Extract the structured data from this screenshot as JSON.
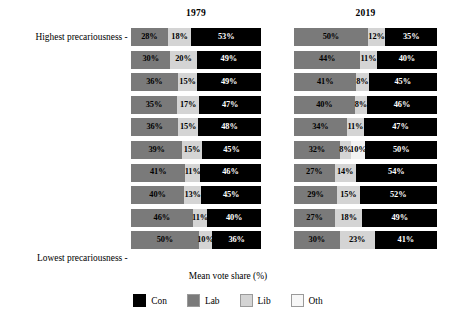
{
  "chart_data": {
    "type": "bar",
    "subtype": "stacked-horizontal-100-percent",
    "title": "",
    "xlabel": "Mean vote share (%)",
    "ylabel": "",
    "xlim": [
      0,
      100
    ],
    "grid": false,
    "legend_position": "bottom-center",
    "panels": [
      {
        "key": "p1979",
        "label": "1979"
      },
      {
        "key": "p2019",
        "label": "2019"
      }
    ],
    "categories": [
      "Highest precariousness",
      "",
      "",
      "",
      "",
      "",
      "",
      "",
      "",
      "Lowest precariousness"
    ],
    "axis_tick_labels": {
      "top": "Highest precariousness",
      "bottom": "Lowest precariousness"
    },
    "legend": [
      {
        "name": "Con",
        "color": "#000000"
      },
      {
        "name": "Lab",
        "color": "#7a7a7a"
      },
      {
        "name": "Lib",
        "color": "#d4d4d4"
      },
      {
        "name": "Oth",
        "color": "#f7f7f7"
      }
    ],
    "series_order": [
      "Lab",
      "Lib",
      "Oth",
      "Con"
    ],
    "p1979": [
      {
        "row": 1,
        "Lab": 28,
        "Lib": 18,
        "Oth": 0,
        "Con": 53
      },
      {
        "row": 2,
        "Lab": 30,
        "Lib": 20,
        "Oth": 0,
        "Con": 49
      },
      {
        "row": 3,
        "Lab": 36,
        "Lib": 15,
        "Oth": 0,
        "Con": 49
      },
      {
        "row": 4,
        "Lab": 35,
        "Lib": 17,
        "Oth": 0,
        "Con": 47
      },
      {
        "row": 5,
        "Lab": 36,
        "Lib": 15,
        "Oth": 0,
        "Con": 48
      },
      {
        "row": 6,
        "Lab": 39,
        "Lib": 15,
        "Oth": 0,
        "Con": 45
      },
      {
        "row": 7,
        "Lab": 41,
        "Lib": 11,
        "Oth": 0,
        "Con": 46
      },
      {
        "row": 8,
        "Lab": 40,
        "Lib": 13,
        "Oth": 0,
        "Con": 45
      },
      {
        "row": 9,
        "Lab": 46,
        "Lib": 11,
        "Oth": 0,
        "Con": 40
      },
      {
        "row": 10,
        "Lab": 50,
        "Lib": 10,
        "Oth": 0,
        "Con": 36
      }
    ],
    "p2019": [
      {
        "row": 1,
        "Lab": 50,
        "Lib": 12,
        "Oth": 0,
        "Con": 35
      },
      {
        "row": 2,
        "Lab": 44,
        "Lib": 11,
        "Oth": 0,
        "Con": 40
      },
      {
        "row": 3,
        "Lab": 41,
        "Lib": 8,
        "Oth": 0,
        "Con": 45
      },
      {
        "row": 4,
        "Lab": 40,
        "Lib": 8,
        "Oth": 0,
        "Con": 46
      },
      {
        "row": 5,
        "Lab": 34,
        "Lib": 11,
        "Oth": 0,
        "Con": 47
      },
      {
        "row": 6,
        "Lab": 32,
        "Lib": 8,
        "Oth": 10,
        "Con": 50
      },
      {
        "row": 7,
        "Lab": 27,
        "Lib": 14,
        "Oth": 0,
        "Con": 54
      },
      {
        "row": 8,
        "Lab": 29,
        "Lib": 15,
        "Oth": 0,
        "Con": 52
      },
      {
        "row": 9,
        "Lab": 27,
        "Lib": 18,
        "Oth": 0,
        "Con": 49
      },
      {
        "row": 10,
        "Lab": 30,
        "Lib": 23,
        "Oth": 0,
        "Con": 41
      }
    ],
    "value_labels": {
      "p1979": [
        [
          "28%",
          "18%",
          "",
          "53%"
        ],
        [
          "30%",
          "20%",
          "",
          "49%"
        ],
        [
          "36%",
          "15%",
          "",
          "49%"
        ],
        [
          "35%",
          "17%",
          "",
          "47%"
        ],
        [
          "36%",
          "15%",
          "",
          "48%"
        ],
        [
          "39%",
          "15%",
          "",
          "45%"
        ],
        [
          "41%",
          "11%",
          "",
          "46%"
        ],
        [
          "40%",
          "13%",
          "",
          "45%"
        ],
        [
          "46%",
          "11%",
          "",
          "40%"
        ],
        [
          "50%",
          "10%",
          "",
          "36%"
        ]
      ],
      "p2019": [
        [
          "50%",
          "12%",
          "",
          "35%"
        ],
        [
          "44%",
          "11%",
          "",
          "40%"
        ],
        [
          "41%",
          "8%",
          "",
          "45%"
        ],
        [
          "40%",
          "8%",
          "",
          "46%"
        ],
        [
          "34%",
          "11%",
          "",
          "47%"
        ],
        [
          "32%",
          "8%",
          "10%",
          "50%"
        ],
        [
          "27%",
          "14%",
          "",
          "54%"
        ],
        [
          "29%",
          "15%",
          "",
          "52%"
        ],
        [
          "27%",
          "18%",
          "",
          "49%"
        ],
        [
          "30%",
          "23%",
          "",
          "41%"
        ]
      ]
    },
    "colors": {
      "con": "#000000",
      "lab": "#7a7a7a",
      "lib": "#d4d4d4",
      "oth": "#f2f2f2",
      "background": "#ffffff",
      "text": "#000000"
    }
  }
}
